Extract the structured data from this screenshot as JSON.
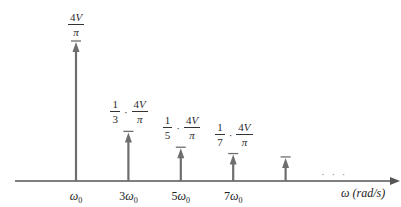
{
  "chart_data": {
    "type": "bar",
    "subtype": "line-spectrum",
    "title": "",
    "xlabel": "ω (rad/s)",
    "ylabel": "",
    "harmonics": [
      1,
      3,
      5,
      7,
      9
    ],
    "values": [
      1,
      0.3333,
      0.2,
      0.1429,
      0.1111
    ],
    "value_unit": "4V/π",
    "tick_labels": [
      "ω0",
      "3ω0",
      "5ω0",
      "7ω0",
      ""
    ],
    "amplitude_labels": [
      {
        "coef": "",
        "num": "4V",
        "den": "π"
      },
      {
        "coef": "1/3",
        "num": "4V",
        "den": "π"
      },
      {
        "coef": "1/5",
        "num": "4V",
        "den": "π"
      },
      {
        "coef": "1/7",
        "num": "4V",
        "den": "π"
      },
      null
    ],
    "continuation": "· · ·",
    "colors": {
      "spike": "#6e6e6e",
      "axis": "#555555"
    }
  }
}
